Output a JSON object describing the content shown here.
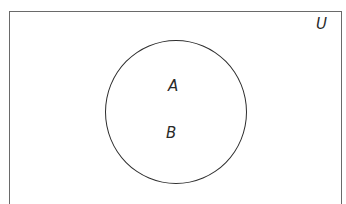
{
  "diagram": {
    "type": "venn",
    "universe": {
      "label": "U"
    },
    "sets": [
      {
        "label": "A"
      },
      {
        "label": "B"
      }
    ],
    "relation": "A = B (single coincident circle)",
    "colors": {
      "outline": "#2e2e2e",
      "frame": "#6a6a6a",
      "background": "#ffffff"
    }
  }
}
